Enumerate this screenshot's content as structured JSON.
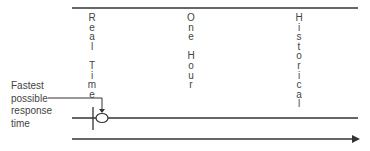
{
  "columns": [
    {
      "label": "Real Time",
      "letters": [
        "R",
        "e",
        "a",
        "l",
        "",
        "T",
        "i",
        "m",
        "e"
      ]
    },
    {
      "label": "One Hour",
      "letters": [
        "O",
        "n",
        "e",
        "",
        "H",
        "o",
        "u",
        "r"
      ]
    },
    {
      "label": "Historical",
      "letters": [
        "H",
        "i",
        "s",
        "t",
        "o",
        "r",
        "i",
        "c",
        "a",
        "l"
      ]
    }
  ],
  "annotation": {
    "lines": [
      "Fastest",
      "possible",
      "response",
      "time"
    ]
  },
  "colors": {
    "line": "#333333",
    "text": "#444444"
  }
}
